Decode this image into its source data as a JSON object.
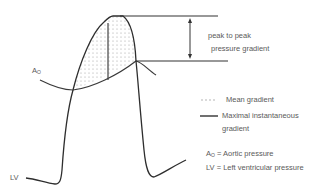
{
  "diagram": {
    "labels": {
      "peak_line1": "peak to peak",
      "peak_line2": "pressure gradient",
      "ao_main": "A",
      "ao_sub": "O",
      "lv": "LV"
    },
    "legend": {
      "mean_gradient": "Mean gradient",
      "maximal_line1": "Maximal instantaneous",
      "maximal_line2": "gradient",
      "ao_def_main": "A",
      "ao_def_sub": "O",
      "ao_def_text": " = Aortic pressure",
      "lv_def": "LV = Left ventricular pressure"
    },
    "colors": {
      "curve": "#333333",
      "dots": "#9a9a9a",
      "text": "#5a5a5a"
    }
  }
}
